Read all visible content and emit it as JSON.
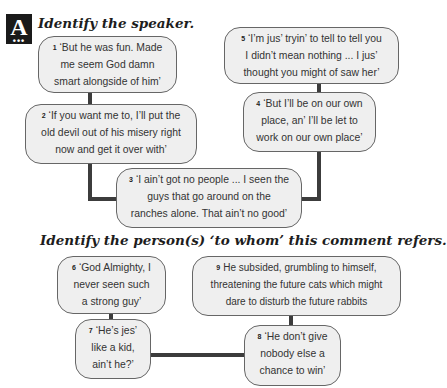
{
  "badge": {
    "letter": "A",
    "dots": "•••"
  },
  "section1": {
    "heading": "Identify the speaker.",
    "quotes": [
      {
        "num": "1",
        "lines": [
          "‘But he was fun. Made",
          "me seem God damn",
          "smart alongside of him’"
        ]
      },
      {
        "num": "2",
        "lines": [
          "‘If you want me to, I’ll put the",
          "old devil out of his misery right",
          "now and get it over with’"
        ]
      },
      {
        "num": "3",
        "lines": [
          "‘I ain’t got no people ... I seen the",
          "guys that go around on the",
          "ranches alone. That ain’t no good’"
        ]
      },
      {
        "num": "4",
        "lines": [
          "‘But I’ll be on our own",
          "place, an’ I’ll be let to",
          "work on our own place’"
        ]
      },
      {
        "num": "5",
        "lines": [
          "‘I’m jus’ tryin’ to tell to tell you",
          "I didn’t mean nothing ... I jus’",
          "thought you might of saw her’"
        ]
      }
    ]
  },
  "section2": {
    "heading": "Identify the person(s) ‘to whom’ this comment refers.",
    "quotes": [
      {
        "num": "6",
        "lines": [
          "‘God Almighty, I",
          "never seen such",
          "a strong guy’"
        ]
      },
      {
        "num": "7",
        "lines": [
          "‘He’s jes’",
          "like a kid,",
          "ain’t he?’"
        ]
      },
      {
        "num": "8",
        "lines": [
          "‘He don’t give",
          "nobody else a",
          "chance to win’"
        ]
      },
      {
        "num": "9",
        "lines": [
          "He subsided, grumbling to himself,",
          "threatening the future cats which might",
          "dare to disturb the future rabbits"
        ]
      }
    ]
  }
}
